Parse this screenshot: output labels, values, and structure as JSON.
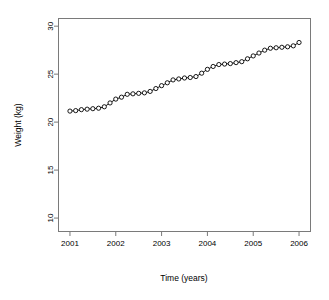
{
  "chart_data": {
    "type": "line",
    "title": "",
    "subtitle": "",
    "xlabel": "Time (years)",
    "ylabel": "Weight (kg)",
    "xlim": [
      2000.75,
      2006.25
    ],
    "ylim": [
      8.6,
      30.8
    ],
    "xticks": [
      2001,
      2002,
      2003,
      2004,
      2005,
      2006
    ],
    "xticklabels": [
      "2001",
      "2002",
      "2003",
      "2004",
      "2005",
      "2006"
    ],
    "yticks": [
      10,
      15,
      20,
      25,
      30
    ],
    "yticklabels": [
      "10",
      "15",
      "20",
      "25",
      "30"
    ],
    "grid": false,
    "legend": null,
    "marker": "open-circle",
    "line_color": "#000000",
    "marker_color": "#000000",
    "series": [
      {
        "name": "Weight",
        "x": [
          2001.0,
          2001.125,
          2001.25,
          2001.375,
          2001.5,
          2001.625,
          2001.75,
          2001.875,
          2002.0,
          2002.125,
          2002.25,
          2002.375,
          2002.5,
          2002.625,
          2002.75,
          2002.875,
          2003.0,
          2003.125,
          2003.25,
          2003.375,
          2003.5,
          2003.625,
          2003.75,
          2003.875,
          2004.0,
          2004.125,
          2004.25,
          2004.375,
          2004.5,
          2004.625,
          2004.75,
          2004.875,
          2005.0,
          2005.125,
          2005.25,
          2005.375,
          2005.5,
          2005.625,
          2005.75,
          2005.875,
          2006.0
        ],
        "values": [
          21.15,
          21.2,
          21.3,
          21.35,
          21.4,
          21.45,
          21.6,
          22.0,
          22.4,
          22.6,
          22.9,
          22.95,
          23.0,
          23.05,
          23.2,
          23.5,
          23.8,
          24.1,
          24.4,
          24.5,
          24.6,
          24.65,
          24.75,
          25.1,
          25.5,
          25.8,
          26.0,
          26.05,
          26.1,
          26.2,
          26.3,
          26.6,
          26.9,
          27.2,
          27.5,
          27.7,
          27.75,
          27.8,
          27.85,
          27.95,
          28.3
        ]
      }
    ]
  }
}
